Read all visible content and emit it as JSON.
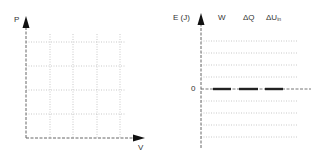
{
  "pv_diagram": {
    "y_axis_label": "P",
    "x_axis_label": "V",
    "grid": {
      "columns": 4,
      "rows": 4,
      "style": "dotted"
    }
  },
  "energy_chart": {
    "y_axis_label": "E (J)",
    "zero_label": "0",
    "columns": [
      {
        "label": "W",
        "value": 0
      },
      {
        "label": "ΔQ",
        "value": 0
      },
      {
        "label": "ΔU",
        "subscript": "in",
        "value": 0
      }
    ],
    "gridlines_above_zero": 4,
    "gridlines_below_zero": 4
  },
  "colors": {
    "axis": "#555555",
    "grid": "#bbbbbb",
    "bar": "#222222",
    "text": "#333333"
  }
}
